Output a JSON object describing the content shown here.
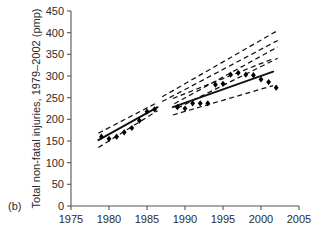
{
  "panel": {
    "label": "(b)"
  },
  "chart_data": {
    "type": "scatter",
    "title": "",
    "subtitle": "",
    "xlabel": "",
    "ylabel": "Total non-fatal injuries, 1979–2002 (pmp)",
    "xlim": [
      1975,
      2005
    ],
    "ylim": [
      0,
      450
    ],
    "xticks": [
      1975,
      1980,
      1985,
      1990,
      1995,
      2000,
      2005
    ],
    "yticks": [
      0,
      50,
      100,
      150,
      200,
      250,
      300,
      350,
      400,
      450
    ],
    "xticklabels": [
      "1975",
      "1980",
      "1985",
      "1990",
      "1995",
      "2000",
      "2005"
    ],
    "yticklabels": [
      "0",
      "50",
      "100",
      "150",
      "200",
      "250",
      "300",
      "350",
      "400",
      "450"
    ],
    "grid": false,
    "legend": null,
    "legend_position": "none",
    "series": [
      {
        "name": "Observed total non-fatal injuries",
        "type": "scatter",
        "marker": "diamond",
        "color": "#000000",
        "x": [
          1979,
          1980,
          1981,
          1982,
          1983,
          1984,
          1985,
          1986,
          1989,
          1990,
          1991,
          1992,
          1993,
          1994,
          1995,
          1996,
          1997,
          1998,
          1999,
          2000,
          2001,
          2002
        ],
        "y": [
          160,
          155,
          160,
          170,
          180,
          197,
          218,
          223,
          228,
          225,
          237,
          237,
          237,
          280,
          282,
          303,
          307,
          303,
          302,
          292,
          286,
          273
        ]
      },
      {
        "name": "Fitted trend (segment 1)",
        "type": "line",
        "style": "solid",
        "color": "#000000",
        "x": [
          1978.6,
          1986.4
        ],
        "y": [
          152,
          228
        ]
      },
      {
        "name": "Fitted trend (segment 2)",
        "type": "line",
        "style": "solid",
        "color": "#000000",
        "x": [
          1988.4,
          2001.6
        ],
        "y": [
          228,
          310
        ]
      },
      {
        "name": "95% CI lower (segment 1)",
        "type": "line",
        "style": "dashed",
        "color": "#000000",
        "x": [
          1978.6,
          1986.4
        ],
        "y": [
          135,
          220
        ]
      },
      {
        "name": "95% CI upper (segment 1)",
        "type": "line",
        "style": "dashed",
        "color": "#000000",
        "x": [
          1978.6,
          1986.4
        ],
        "y": [
          168,
          239
        ]
      },
      {
        "name": "95% CI lower (segment 2)",
        "type": "line",
        "style": "dashed",
        "color": "#000000",
        "x": [
          1988.4,
          2001.6
        ],
        "y": [
          210,
          278
        ]
      },
      {
        "name": "95% CI upper (segment 2)",
        "type": "line",
        "style": "dashed",
        "color": "#000000",
        "x": [
          1988.4,
          2001.6
        ],
        "y": [
          248,
          340
        ]
      },
      {
        "name": "Projection fan band 1",
        "type": "line",
        "style": "dashed",
        "color": "#000000",
        "x": [
          1987.0,
          2002.2
        ],
        "y": [
          252,
          405
        ]
      },
      {
        "name": "Projection fan band 2",
        "type": "line",
        "style": "dashed",
        "color": "#000000",
        "x": [
          1987.0,
          2002.2
        ],
        "y": [
          241,
          382
        ]
      },
      {
        "name": "Projection fan band 3",
        "type": "line",
        "style": "dashed",
        "color": "#000000",
        "x": [
          1988.6,
          2002.2
        ],
        "y": [
          236,
          367
        ]
      },
      {
        "name": "Projection fan band 4",
        "type": "line",
        "style": "dashed",
        "color": "#000000",
        "x": [
          1989.0,
          2002.2
        ],
        "y": [
          226,
          341
        ]
      }
    ],
    "annotations": [
      {
        "text": "(b)",
        "role": "panel-label"
      }
    ]
  }
}
